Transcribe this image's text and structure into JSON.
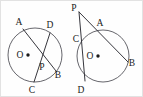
{
  "figure": {
    "background_color": "#fefefe",
    "stroke_color": "#2b2b33",
    "circle_stroke_color": "#4a4a52",
    "label_color": "#1a1a1a",
    "border_color": "#e2e2e2",
    "width": 143,
    "height": 97
  },
  "diagrams": [
    {
      "id": "left-diagram",
      "name": "intersecting-chords-inside-circle",
      "description": "Circle with center O; chords AB and CD intersect at interior point P",
      "circle": {
        "cx": 35,
        "cy": 55,
        "r": 27
      },
      "center_label": "O",
      "center_label_x": 20,
      "center_label_y": 58,
      "center_dot_x": 28,
      "center_dot_y": 55,
      "center_dot_r": 1.7,
      "points": [
        {
          "label": "A",
          "px": 23,
          "py": 29,
          "lx": 19,
          "ly": 25
        },
        {
          "label": "D",
          "px": 50,
          "py": 33,
          "lx": 50,
          "ly": 28
        },
        {
          "label": "B",
          "px": 56,
          "py": 71,
          "lx": 57,
          "ly": 77
        },
        {
          "label": "C",
          "px": 34,
          "py": 82,
          "lx": 31,
          "ly": 92
        },
        {
          "label": "P",
          "px": 44,
          "py": 62,
          "lx": 41,
          "ly": 69
        }
      ],
      "segments": [
        {
          "name": "chord-A-B",
          "from": "A",
          "to": "B"
        },
        {
          "name": "chord-D-C",
          "from": "D",
          "to": "C"
        }
      ]
    },
    {
      "id": "right-diagram",
      "name": "external-point-two-secants",
      "description": "Circle with center O; external point P with secant through C and D and secant through A and B",
      "circle": {
        "cx": 103,
        "cy": 56,
        "r": 26
      },
      "center_label": "O",
      "center_label_x": 90,
      "center_label_y": 59,
      "center_dot_x": 98,
      "center_dot_y": 56,
      "center_dot_r": 1.7,
      "points": [
        {
          "label": "P",
          "px": 79,
          "py": 12,
          "lx": 74,
          "ly": 10
        },
        {
          "label": "A",
          "px": 100,
          "py": 30,
          "lx": 99,
          "ly": 26
        },
        {
          "label": "C",
          "px": 81,
          "py": 38,
          "lx": 75,
          "ly": 41
        },
        {
          "label": "B",
          "px": 128,
          "py": 62,
          "lx": 130,
          "ly": 66
        },
        {
          "label": "D",
          "px": 85,
          "py": 81,
          "lx": 80,
          "ly": 92
        }
      ],
      "segments": [
        {
          "name": "secant-P-C-D",
          "from": "P",
          "to": "D"
        },
        {
          "name": "secant-P-A-B",
          "from": "P",
          "to": "B"
        }
      ]
    }
  ]
}
